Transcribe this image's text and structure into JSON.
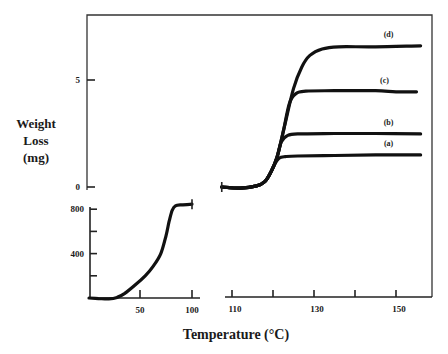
{
  "chart_data": {
    "type": "line",
    "title": "",
    "xlabel": "Temperature (°C)",
    "ylabel_lines": [
      "Weight",
      "Loss",
      "(mg)"
    ],
    "broken_x_axis": true,
    "upper_panel": {
      "xlim": [
        105,
        158
      ],
      "ylim": [
        0,
        7
      ],
      "x_ticks": [
        110,
        120,
        130,
        140,
        150
      ],
      "x_tick_labels": [
        "110",
        "",
        "130",
        "",
        "150"
      ],
      "y_ticks": [
        0,
        5
      ],
      "y_tick_labels": [
        "0",
        "5"
      ],
      "series": [
        {
          "name": "(a)",
          "x": [
            107.5,
            112,
            116,
            118,
            119.5,
            120.5,
            121.5,
            123,
            126,
            135,
            145,
            156
          ],
          "y": [
            0,
            -0.05,
            0.05,
            0.25,
            0.7,
            1.1,
            1.35,
            1.42,
            1.45,
            1.47,
            1.5,
            1.5
          ]
        },
        {
          "name": "(b)",
          "x": [
            107.5,
            112,
            116,
            118,
            119.5,
            121,
            122,
            123.5,
            126,
            135,
            145,
            156
          ],
          "y": [
            0,
            -0.05,
            0.05,
            0.25,
            0.7,
            1.4,
            2.1,
            2.4,
            2.48,
            2.5,
            2.5,
            2.48
          ]
        },
        {
          "name": "(c)",
          "x": [
            107.5,
            112,
            116,
            118,
            119.5,
            121,
            122.5,
            124,
            125.5,
            128,
            135,
            145,
            150,
            155
          ],
          "y": [
            0,
            -0.05,
            0.05,
            0.25,
            0.7,
            1.4,
            2.6,
            3.9,
            4.35,
            4.48,
            4.5,
            4.5,
            4.45,
            4.45
          ]
        },
        {
          "name": "(d)",
          "x": [
            107.5,
            112,
            116,
            118,
            119.5,
            121,
            123,
            125,
            127,
            129,
            132,
            136,
            145,
            156
          ],
          "y": [
            0,
            -0.05,
            0.05,
            0.25,
            0.7,
            1.4,
            3.0,
            4.6,
            5.6,
            6.15,
            6.45,
            6.55,
            6.55,
            6.6
          ]
        }
      ]
    },
    "lower_panel": {
      "xlim": [
        0,
        105
      ],
      "ylim": [
        0,
        850
      ],
      "x_ticks": [
        50,
        100
      ],
      "x_tick_labels": [
        "50",
        "100"
      ],
      "y_ticks": [
        200,
        400,
        600,
        800
      ],
      "y_tick_labels": [
        "",
        "400",
        "",
        "800"
      ],
      "series": [
        {
          "name": "lower",
          "x": [
            1,
            10,
            20,
            28,
            35,
            45,
            55,
            63,
            70,
            75,
            78,
            81,
            84,
            90,
            100
          ],
          "y": [
            0,
            -5,
            -8,
            5,
            40,
            115,
            200,
            290,
            400,
            560,
            690,
            790,
            830,
            840,
            845
          ]
        }
      ]
    },
    "legend": "inline-labels"
  }
}
